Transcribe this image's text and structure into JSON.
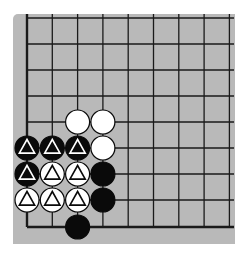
{
  "board": {
    "columns": 9,
    "rows": 9,
    "x_lines": [
      27,
      52.3,
      77.6,
      102.9,
      128.2,
      153.5,
      178.8,
      204.1,
      229.4
    ],
    "y_lines": [
      18,
      44,
      70,
      96,
      122,
      148,
      174,
      200,
      227
    ],
    "edges": {
      "left": true,
      "bottom": true,
      "top": false,
      "right": false
    },
    "colors": {
      "board": "#b9b9b9",
      "line": "#1a1a1a",
      "black": "#0a0a0a",
      "white": "#ffffff"
    }
  },
  "stones": [
    {
      "col": 2,
      "row": 4,
      "color": "white",
      "mark": ""
    },
    {
      "col": 3,
      "row": 4,
      "color": "white",
      "mark": ""
    },
    {
      "col": 0,
      "row": 5,
      "color": "black",
      "mark": "triangle"
    },
    {
      "col": 1,
      "row": 5,
      "color": "black",
      "mark": "triangle"
    },
    {
      "col": 2,
      "row": 5,
      "color": "black",
      "mark": "triangle"
    },
    {
      "col": 3,
      "row": 5,
      "color": "white",
      "mark": ""
    },
    {
      "col": 0,
      "row": 6,
      "color": "black",
      "mark": "triangle"
    },
    {
      "col": 1,
      "row": 6,
      "color": "white",
      "mark": "triangle"
    },
    {
      "col": 2,
      "row": 6,
      "color": "white",
      "mark": "triangle"
    },
    {
      "col": 3,
      "row": 6,
      "color": "black",
      "mark": ""
    },
    {
      "col": 0,
      "row": 7,
      "color": "white",
      "mark": "triangle"
    },
    {
      "col": 1,
      "row": 7,
      "color": "white",
      "mark": "triangle"
    },
    {
      "col": 2,
      "row": 7,
      "color": "white",
      "mark": "triangle"
    },
    {
      "col": 3,
      "row": 7,
      "color": "black",
      "mark": ""
    },
    {
      "col": 2,
      "row": 8,
      "color": "black",
      "mark": ""
    }
  ]
}
